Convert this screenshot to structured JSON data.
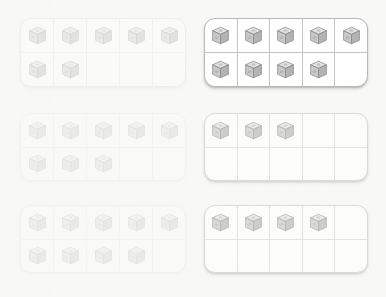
{
  "scene": {
    "kind": "ten-frame-counting-worksheet",
    "background_color": "#f8f8f6",
    "frame_fill_color": "#ffffff",
    "frame_border_color": "#b9b9b9",
    "grid_line_color": "#c4c4c4",
    "columns": 5,
    "rows": 2,
    "capacity": 10,
    "counter_icon": "cube-icon",
    "counter_label": "unit cube",
    "cube_colors": {
      "top_face": "#e3e3e3",
      "left_face": "#c9c9c9",
      "right_face": "#b3b3b3",
      "outline": "#8f8f8f",
      "dimple": "#a8a8a8"
    }
  },
  "frames": [
    {
      "id": "frame-1",
      "position": "top-left",
      "count": 7,
      "top_row_filled": 5,
      "bottom_row_filled": 2,
      "empty_cells": 3,
      "render_strength": "faint",
      "x": 20,
      "y": 18,
      "width": 166,
      "height": 69
    },
    {
      "id": "frame-2",
      "position": "top-right",
      "count": 9,
      "top_row_filled": 5,
      "bottom_row_filled": 4,
      "empty_cells": 1,
      "render_strength": "strong",
      "x": 204,
      "y": 18,
      "width": 164,
      "height": 69
    },
    {
      "id": "frame-3",
      "position": "middle-left",
      "count": 8,
      "top_row_filled": 5,
      "bottom_row_filled": 3,
      "empty_cells": 2,
      "render_strength": "ghost",
      "x": 20,
      "y": 113,
      "width": 166,
      "height": 68
    },
    {
      "id": "frame-4",
      "position": "middle-right",
      "count": 3,
      "top_row_filled": 3,
      "bottom_row_filled": 0,
      "empty_cells": 7,
      "render_strength": "mid",
      "x": 204,
      "y": 113,
      "width": 164,
      "height": 68
    },
    {
      "id": "frame-5",
      "position": "bottom-left",
      "count": 9,
      "top_row_filled": 5,
      "bottom_row_filled": 4,
      "empty_cells": 1,
      "render_strength": "ghost",
      "x": 20,
      "y": 205,
      "width": 166,
      "height": 68
    },
    {
      "id": "frame-6",
      "position": "bottom-right",
      "count": 4,
      "top_row_filled": 4,
      "bottom_row_filled": 0,
      "empty_cells": 6,
      "render_strength": "mid",
      "x": 204,
      "y": 205,
      "width": 164,
      "height": 68
    }
  ]
}
